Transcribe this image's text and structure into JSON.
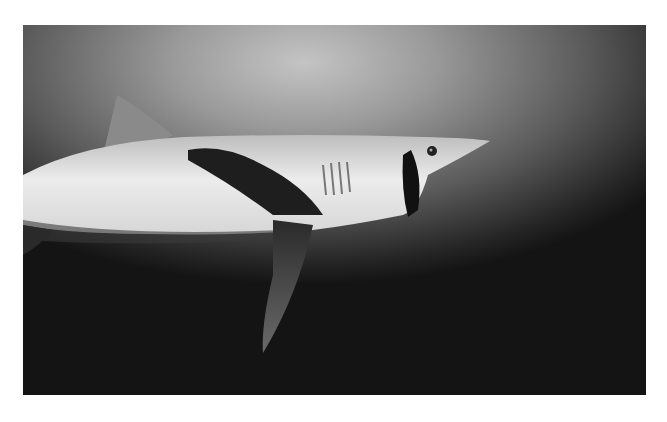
{
  "photo": {
    "subject": "shark swimming underwater",
    "style": "black-and-white",
    "alt": "Black-and-white underwater photograph of a mako shark swimming to the right with its mouth open"
  }
}
